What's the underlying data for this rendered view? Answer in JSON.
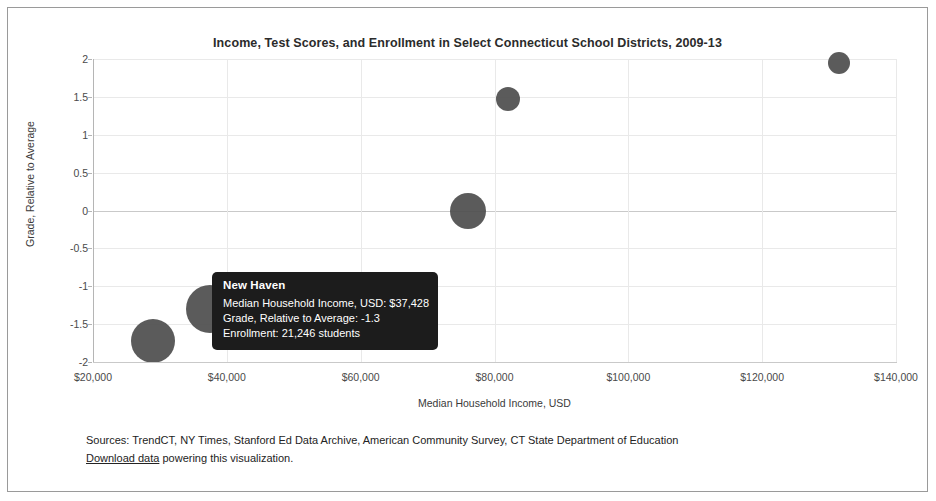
{
  "chart_data": {
    "type": "scatter",
    "title": "Income, Test Scores, and Enrollment in Select Connecticut School Districts, 2009-13",
    "xlabel": "Median Household Income, USD",
    "ylabel": "Grade, Relative to Average",
    "xlim": [
      20000,
      140000
    ],
    "ylim": [
      -2,
      2
    ],
    "grid": true,
    "legend": "none",
    "xticks": [
      "$20,000",
      "$40,000",
      "$60,000",
      "$80,000",
      "$100,000",
      "$120,000",
      "$140,000"
    ],
    "xtick_values": [
      20000,
      40000,
      60000,
      80000,
      100000,
      120000,
      140000
    ],
    "yticks": [
      "2",
      "1.5",
      "1",
      "0.5",
      "0",
      "-0.5",
      "-1",
      "-1.5",
      "-2"
    ],
    "ytick_values": [
      2,
      1.5,
      1,
      0.5,
      0,
      -0.5,
      -1,
      -1.5,
      -2
    ],
    "size_encoding": "Enrollment (students)",
    "points": [
      {
        "name": "Bridgeport",
        "x": 29000,
        "y": -1.72,
        "r": 22,
        "enrollment": 20000
      },
      {
        "name": "New Haven",
        "x": 37428,
        "y": -1.3,
        "r": 24,
        "enrollment": 21246
      },
      {
        "name": "District C",
        "x": 76000,
        "y": 0.0,
        "r": 18,
        "enrollment": 12000
      },
      {
        "name": "District D",
        "x": 82000,
        "y": 1.47,
        "r": 12,
        "enrollment": 5000
      },
      {
        "name": "District E",
        "x": 131500,
        "y": 1.95,
        "r": 11,
        "enrollment": 4000
      }
    ],
    "point_color": "#4d4d4d"
  },
  "tooltip": {
    "title": "New Haven",
    "rows": [
      "Median Household Income, USD: $37,428",
      "Grade, Relative to Average: -1.3",
      "Enrollment: 21,246 students"
    ]
  },
  "footer": {
    "sources": "Sources: TrendCT, NY Times, Stanford Ed Data Archive, American Community Survey, CT State Department of Education",
    "download_link": "Download data",
    "download_rest": " powering this visualization."
  }
}
